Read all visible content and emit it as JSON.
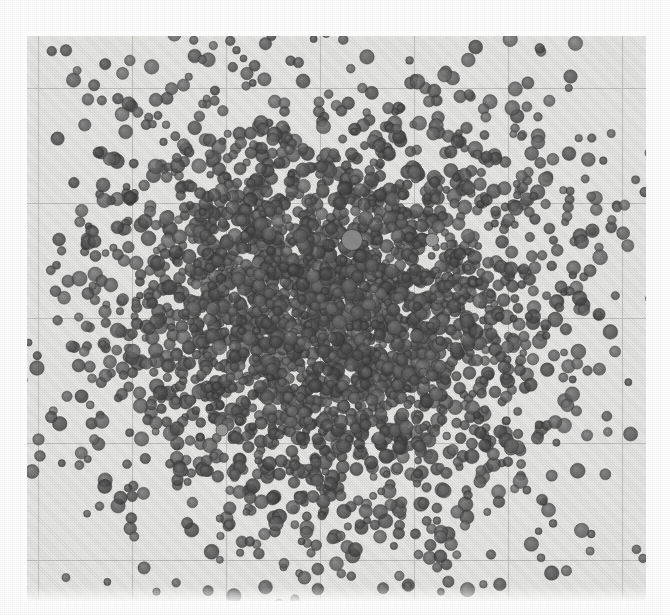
{
  "figure": {
    "title": "",
    "caption": "",
    "kind": "scanned-halftone-scatter-plot"
  },
  "chart_data": {
    "type": "scatter",
    "title": "",
    "subtitle": "",
    "xlabel": "",
    "ylabel": "",
    "legend": [],
    "legend_position": "none",
    "grid": true,
    "grid_color": "#c2c2bf",
    "background_color": "#e9e9e7",
    "page_color": "#ffffff",
    "marker_color": "#6a6a6a",
    "marker_edge_color": "#4a4a4a",
    "marker_shape": "circle",
    "marker_size_px": [
      7,
      15
    ],
    "marker_opacity": 0.82,
    "n_points": 3400,
    "xlim": [
      0,
      670
    ],
    "ylim": [
      0,
      615
    ],
    "xticks": [
      38,
      132,
      226,
      320,
      414,
      508,
      622
    ],
    "yticks": [
      88,
      203,
      318,
      443,
      560
    ],
    "xticklabels": [],
    "yticklabels": [],
    "plot_rect": {
      "x": 27,
      "y": 36,
      "width": 619,
      "height": 565
    },
    "distribution": {
      "family": "bivariate-normal-with-heavy-tails",
      "center_x": 332,
      "center_y": 312,
      "sigma_x": 108,
      "sigma_y": 104,
      "core_fraction": 0.74,
      "halo_sigma_scale": 2.35,
      "outlier_fraction": 0.09,
      "notes": "dense saturated core fading to sparse scattered outliers toward the plot edges"
    },
    "highlights": [
      {
        "x": 352,
        "y": 240,
        "size": 21,
        "shade": "#8c8c8c",
        "label": "largest-light-marker"
      },
      {
        "x": 432,
        "y": 240,
        "size": 13,
        "shade": "#9a9a9a",
        "label": "light-marker"
      },
      {
        "x": 222,
        "y": 430,
        "size": 12,
        "shade": "#9a9a9a",
        "label": "light-marker"
      }
    ]
  },
  "axes": {
    "x_gridline_spacing_px": 94,
    "y_gridline_spacing_px": 115,
    "border_visible": false
  }
}
